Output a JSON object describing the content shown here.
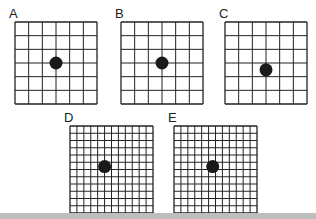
{
  "panels": [
    {
      "label": "A",
      "x": 15,
      "y": 22,
      "w": 82,
      "h": 82,
      "cells": 6,
      "dot": {
        "cx": 3,
        "cy": 3
      }
    },
    {
      "label": "B",
      "x": 121,
      "y": 22,
      "w": 82,
      "h": 82,
      "cells": 6,
      "dot": {
        "cx": 3,
        "cy": 3
      }
    },
    {
      "label": "C",
      "x": 225,
      "y": 22,
      "w": 82,
      "h": 82,
      "cells": 6,
      "dot": {
        "cx": 3,
        "cy": 3.5
      }
    },
    {
      "label": "D",
      "x": 70,
      "y": 126,
      "w": 83,
      "h": 87,
      "cells": 12,
      "dot": {
        "cx": 5,
        "cy": 5.6
      }
    },
    {
      "label": "E",
      "x": 174,
      "y": 126,
      "w": 83,
      "h": 87,
      "cells": 12,
      "dot": {
        "cx": 5.6,
        "cy": 5.6
      }
    }
  ],
  "colors": {
    "grid": "#222222",
    "dot": "#1a1a1a",
    "bar": "#bdbdbd"
  }
}
